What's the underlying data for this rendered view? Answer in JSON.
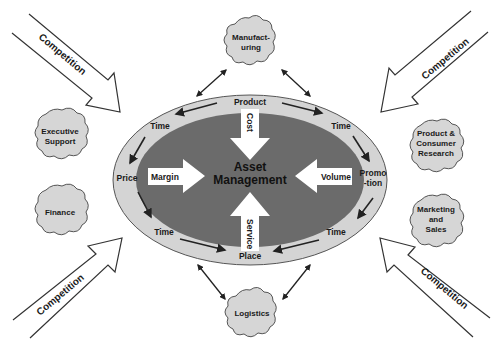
{
  "diagram": {
    "center": {
      "line1": "Asset",
      "line2": "Management"
    },
    "inward_arrows": {
      "top": "Cost",
      "left": "Margin",
      "right": "Volume",
      "bottom": "Service"
    },
    "ring_labels": {
      "top": "Product",
      "top_left_time": "Time",
      "top_right_time": "Time",
      "left": "Price",
      "right_line1": "Promo",
      "right_line2": "-tion",
      "bottom_left_time": "Time",
      "bottom_right_time": "Time",
      "bottom": "Place"
    },
    "clouds": {
      "manufacturing": {
        "line1": "Manufact-",
        "line2": "uring"
      },
      "executive_support": {
        "line1": "Executive",
        "line2": "Support"
      },
      "finance": {
        "line1": "Finance"
      },
      "product_consumer_research": {
        "line1": "Product &",
        "line2": "Consumer",
        "line3": "Research"
      },
      "marketing_sales": {
        "line1": "Marketing",
        "line2": "and",
        "line3": "Sales"
      },
      "logistics": {
        "line1": "Logistics"
      }
    },
    "competition_arrows": {
      "top_left": "Competition",
      "top_right": "Competition",
      "bottom_left": "Competition",
      "bottom_right": "Competition"
    },
    "colors": {
      "outer_ring": "#d4d4d4",
      "inner_core": "#6b6b6b",
      "cloud_fill": "#d6d6d6",
      "stroke": "#333333",
      "inward_arrow_fill": "#ffffff"
    }
  }
}
